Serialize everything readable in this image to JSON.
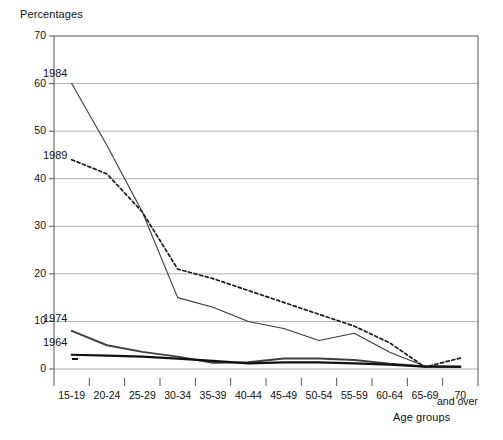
{
  "chart_data": {
    "type": "line",
    "title": "",
    "ylabel": "Percentages",
    "xlabel": "Age groups",
    "ylim": [
      0,
      70
    ],
    "yticks": [
      0,
      10,
      20,
      30,
      40,
      50,
      60,
      70
    ],
    "grid": true,
    "legend_position": "inline-labels-left",
    "categories": [
      "15-19",
      "20-24",
      "25-29",
      "30-34",
      "35-39",
      "40-44",
      "45-49",
      "50-54",
      "55-59",
      "60-64",
      "65-69",
      "70 and over"
    ],
    "tick_labels": [
      "15-19",
      "20-24",
      "25-29",
      "30-34",
      "35-39",
      "40-44",
      "45-49",
      "50-54",
      "55-59",
      "60-64",
      "65-69",
      "70"
    ],
    "last_tick_sub_label": "and over",
    "series": [
      {
        "name": "1984",
        "style": "solid-thin",
        "color": "#3a3a3a",
        "values": [
          60,
          47,
          33,
          15,
          13,
          10,
          8.5,
          6,
          7.5,
          3.5,
          0.6,
          0.5
        ]
      },
      {
        "name": "1989",
        "style": "dashed",
        "color": "#1a1a1a",
        "values": [
          44,
          41,
          33,
          21,
          19,
          16.5,
          14,
          11.5,
          9,
          5.5,
          0.4,
          2.3
        ]
      },
      {
        "name": "1974",
        "style": "solid-thick",
        "color": "#404040",
        "values": [
          8,
          5,
          3.6,
          2.6,
          1.3,
          1.4,
          2.2,
          2.2,
          1.9,
          1.1,
          0.5,
          0.4
        ]
      },
      {
        "name": "1964",
        "style": "solid-bold",
        "color": "#111111",
        "values": [
          3,
          2.8,
          2.6,
          2.2,
          1.7,
          1.2,
          1.4,
          1.4,
          1.2,
          0.9,
          0.5,
          0.5
        ]
      }
    ]
  },
  "labels": {
    "y_axis_title": "Percentages",
    "x_axis_title": "Age groups",
    "series_1984": "1984",
    "series_1989": "1989",
    "series_1974": "1974",
    "series_1964": "1964"
  }
}
